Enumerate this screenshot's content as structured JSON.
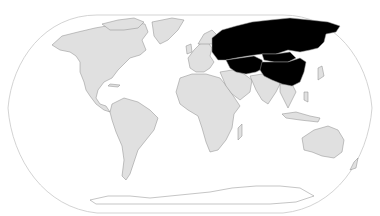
{
  "map": {
    "projection": "robinson-like world map",
    "colors": {
      "background": "#ffffff",
      "frame": "#c8c8c8",
      "land": "#e0e0e0",
      "border": "#8a8a8a",
      "highlight": "#000000",
      "highlight_border": "#9a9a9a",
      "antarctica": "#ffffff"
    },
    "highlighted_regions": [
      "Russia",
      "China",
      "Mongolia",
      "Kazakhstan",
      "Uzbekistan",
      "Turkmenistan",
      "Kyrgyzstan",
      "Tajikistan"
    ],
    "regions": [
      {
        "name": "North America",
        "highlighted": false
      },
      {
        "name": "Greenland",
        "highlighted": false
      },
      {
        "name": "South America",
        "highlighted": false
      },
      {
        "name": "Europe",
        "highlighted": false
      },
      {
        "name": "Africa",
        "highlighted": false
      },
      {
        "name": "Middle East",
        "highlighted": false
      },
      {
        "name": "South Asia",
        "highlighted": false
      },
      {
        "name": "Southeast Asia",
        "highlighted": false
      },
      {
        "name": "Australia",
        "highlighted": false
      },
      {
        "name": "Antarctica",
        "highlighted": false
      }
    ]
  }
}
